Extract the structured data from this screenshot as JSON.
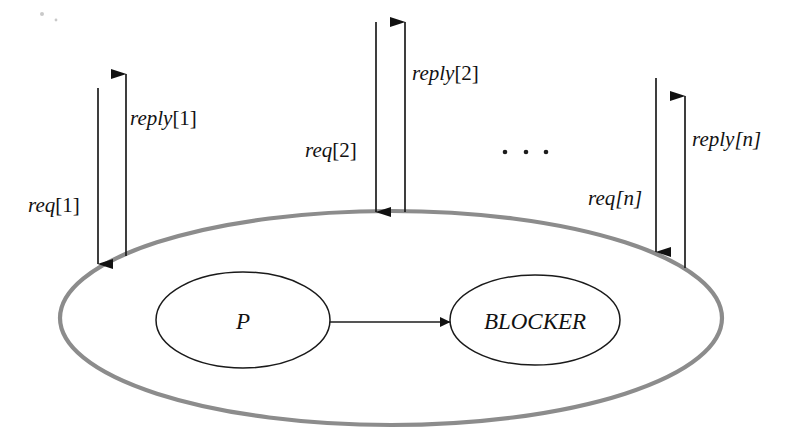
{
  "figure": {
    "background_color": "#ffffff",
    "boundary_color": "#8c8c8c",
    "line_color": "#1d1d1d",
    "text_color": "#121212"
  },
  "nodes": [
    {
      "id": "process-p",
      "label": "P",
      "cx": 243,
      "cy": 320,
      "rx": 87,
      "ry": 48
    },
    {
      "id": "blocker",
      "label": "BLOCKER",
      "cx": 535,
      "cy": 320,
      "rx": 85,
      "ry": 45
    }
  ],
  "boundary": {
    "id": "process-boundary",
    "cx": 391,
    "cy": 318,
    "rx": 331,
    "ry": 107
  },
  "internal_edge": {
    "id": "p-to-blocker",
    "from": "process-p",
    "to": "blocker",
    "x1": 330,
    "x2": 450,
    "y": 322
  },
  "messages": [
    {
      "id": "req-1",
      "name": "req",
      "index": "1",
      "label_prefix": "req",
      "label_suffix": "[1]",
      "direction": "in",
      "x": 98,
      "y_start": 88,
      "y_end": 264,
      "label_x": 28,
      "label_y": 212
    },
    {
      "id": "reply-1",
      "name": "reply",
      "index": "1",
      "label_prefix": "reply",
      "label_suffix": "[1]",
      "direction": "out",
      "x": 126,
      "y_start": 256,
      "y_end": 74,
      "label_x": 130,
      "label_y": 125
    },
    {
      "id": "req-2",
      "name": "req",
      "index": "2",
      "label_prefix": "req",
      "label_suffix": "[2]",
      "direction": "in",
      "x": 376,
      "y_start": 22,
      "y_end": 212,
      "label_x": 305,
      "label_y": 157
    },
    {
      "id": "reply-2",
      "name": "reply",
      "index": "2",
      "label_prefix": "reply",
      "label_suffix": "[2]",
      "direction": "out",
      "x": 405,
      "y_start": 212,
      "y_end": 22,
      "label_x": 412,
      "label_y": 80
    },
    {
      "id": "req-n",
      "name": "req",
      "index": "n",
      "label_prefix": "req",
      "label_suffix": "[n]",
      "direction": "in",
      "x": 656,
      "y_start": 78,
      "y_end": 252,
      "label_x": 588,
      "label_y": 205
    },
    {
      "id": "reply-n",
      "name": "reply",
      "index": "n",
      "label_prefix": "reply",
      "label_suffix": "[n]",
      "direction": "out",
      "x": 685,
      "y_start": 268,
      "y_end": 96,
      "label_x": 692,
      "label_y": 146
    }
  ],
  "ellipsis": {
    "id": "messages-ellipsis",
    "label": ". . .",
    "dots": [
      {
        "cx": 505,
        "cy": 152
      },
      {
        "cx": 526,
        "cy": 152
      },
      {
        "cx": 546,
        "cy": 152
      }
    ]
  },
  "specks": [
    {
      "cx": 42,
      "cy": 14,
      "r": 2.0
    },
    {
      "cx": 56,
      "cy": 20,
      "r": 1.4
    }
  ]
}
